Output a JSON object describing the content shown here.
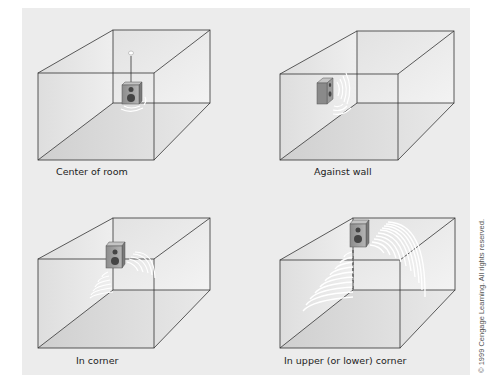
{
  "figure": {
    "panels": [
      {
        "id": "center",
        "label": "Center of room",
        "speaker_position": "center of room (suspended)"
      },
      {
        "id": "wall",
        "label": "Against wall",
        "speaker_position": "against wall"
      },
      {
        "id": "corner",
        "label": "In corner",
        "speaker_position": "in corner"
      },
      {
        "id": "upper-corner",
        "label": "In upper (or lower) corner",
        "speaker_position": "in upper (or lower) corner"
      }
    ],
    "copyright": "© 1999 Cengage Learning. All rights reserved."
  },
  "colors": {
    "background": "#ececec",
    "line": "#333333",
    "speaker_body": "#9a9a9a",
    "sound_waves": "#ffffff"
  }
}
